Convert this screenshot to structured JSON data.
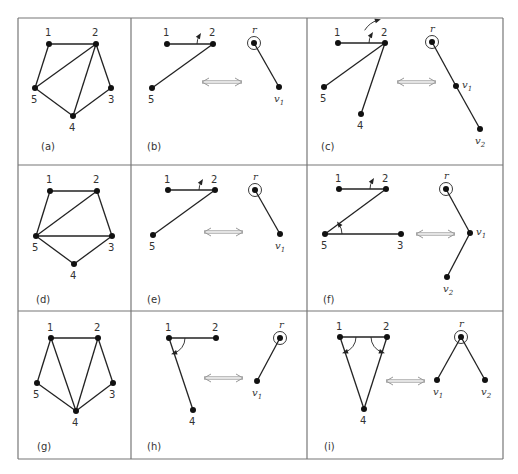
{
  "figure": {
    "grid": {
      "left": 18,
      "top": 18,
      "right": 503,
      "bottom": 459,
      "cols": [
        18,
        131,
        307,
        503
      ],
      "rows": [
        18,
        165,
        311,
        459
      ],
      "stroke": "#777777"
    },
    "colors": {
      "edge": "#222222",
      "node": "#111111",
      "arrow": "#999999",
      "label": "#333333"
    },
    "panels": [
      {
        "id": "a",
        "caption": "(a)",
        "caption_pos": [
          41,
          150
        ],
        "nodes": [
          {
            "id": "1",
            "x": 49,
            "y": 44,
            "lx": 45,
            "ly": 36
          },
          {
            "id": "2",
            "x": 96,
            "y": 44,
            "lx": 92,
            "ly": 36
          },
          {
            "id": "3",
            "x": 111,
            "y": 88,
            "lx": 108,
            "ly": 103
          },
          {
            "id": "4",
            "x": 73,
            "y": 116,
            "lx": 69,
            "ly": 131
          },
          {
            "id": "5",
            "x": 35,
            "y": 88,
            "lx": 31,
            "ly": 103
          }
        ],
        "edges": [
          [
            "1",
            "2"
          ],
          [
            "1",
            "5"
          ],
          [
            "2",
            "5"
          ],
          [
            "2",
            "4"
          ],
          [
            "2",
            "3"
          ],
          [
            "3",
            "4"
          ],
          [
            "4",
            "5"
          ]
        ],
        "angles": [],
        "tree": null,
        "arrow": null
      },
      {
        "id": "b",
        "caption": "(b)",
        "caption_pos": [
          147,
          150
        ],
        "nodes": [
          {
            "id": "1",
            "x": 167,
            "y": 44,
            "lx": 163,
            "ly": 36
          },
          {
            "id": "2",
            "x": 213,
            "y": 44,
            "lx": 209,
            "ly": 36
          },
          {
            "id": "5",
            "x": 152,
            "y": 88,
            "lx": 148,
            "ly": 103
          }
        ],
        "edges": [
          [
            "1",
            "2"
          ],
          [
            "2",
            "5"
          ]
        ],
        "angles": [
          {
            "cx": 213,
            "cy": 44,
            "r": 16,
            "from": 180,
            "to": 212
          }
        ],
        "arrow": {
          "x1": 202,
          "x2": 242,
          "y": 82
        },
        "tree": {
          "root": {
            "label": "r",
            "x": 254,
            "y": 43,
            "lx": 252,
            "ly": 33
          },
          "nodes": [
            {
              "label": "v",
              "sub": "1",
              "x": 279,
              "y": 87,
              "lx": 274,
              "ly": 102
            }
          ],
          "edges": [
            [
              "r",
              "v1"
            ]
          ]
        }
      },
      {
        "id": "c",
        "caption": "(c)",
        "caption_pos": [
          321,
          150
        ],
        "nodes": [
          {
            "id": "1",
            "x": 338,
            "y": 43,
            "lx": 334,
            "ly": 36
          },
          {
            "id": "2",
            "x": 385,
            "y": 43,
            "lx": 381,
            "ly": 36
          },
          {
            "id": "5",
            "x": 324,
            "y": 87,
            "lx": 320,
            "ly": 102
          },
          {
            "id": "4",
            "x": 361,
            "y": 114,
            "lx": 357,
            "ly": 129
          }
        ],
        "edges": [
          [
            "1",
            "2"
          ],
          [
            "2",
            "5"
          ],
          [
            "2",
            "4"
          ]
        ],
        "angles": [
          {
            "cx": 385,
            "cy": 43,
            "r": 16,
            "from": 180,
            "to": 212
          },
          {
            "cx": 385,
            "cy": 43,
            "r": 24,
            "from": 212,
            "to": 253
          }
        ],
        "arrow": {
          "x1": 397,
          "x2": 436,
          "y": 82
        },
        "tree": {
          "root": {
            "label": "r",
            "x": 432,
            "y": 42,
            "lx": 430,
            "ly": 32
          },
          "nodes": [
            {
              "label": "v",
              "sub": "1",
              "x": 456,
              "y": 86,
              "lx": 462,
              "ly": 88
            },
            {
              "label": "v",
              "sub": "2",
              "x": 480,
              "y": 129,
              "lx": 475,
              "ly": 144
            }
          ],
          "edges": [
            [
              "r",
              "v1"
            ],
            [
              "v1",
              "v2"
            ]
          ]
        }
      },
      {
        "id": "d",
        "caption": "(d)",
        "caption_pos": [
          36,
          303
        ],
        "nodes": [
          {
            "id": "1",
            "x": 50,
            "y": 191,
            "lx": 46,
            "ly": 183
          },
          {
            "id": "2",
            "x": 97,
            "y": 191,
            "lx": 93,
            "ly": 183
          },
          {
            "id": "3",
            "x": 112,
            "y": 236,
            "lx": 108,
            "ly": 251
          },
          {
            "id": "4",
            "x": 74,
            "y": 264,
            "lx": 70,
            "ly": 279
          },
          {
            "id": "5",
            "x": 36,
            "y": 236,
            "lx": 32,
            "ly": 251
          }
        ],
        "edges": [
          [
            "1",
            "2"
          ],
          [
            "1",
            "5"
          ],
          [
            "2",
            "5"
          ],
          [
            "2",
            "3"
          ],
          [
            "5",
            "3"
          ],
          [
            "3",
            "4"
          ],
          [
            "4",
            "5"
          ]
        ],
        "angles": [],
        "tree": null,
        "arrow": null
      },
      {
        "id": "e",
        "caption": "(e)",
        "caption_pos": [
          147,
          303
        ],
        "nodes": [
          {
            "id": "1",
            "x": 168,
            "y": 190,
            "lx": 164,
            "ly": 183
          },
          {
            "id": "2",
            "x": 215,
            "y": 190,
            "lx": 211,
            "ly": 183
          },
          {
            "id": "5",
            "x": 153,
            "y": 235,
            "lx": 149,
            "ly": 250
          }
        ],
        "edges": [
          [
            "1",
            "2"
          ],
          [
            "2",
            "5"
          ]
        ],
        "angles": [
          {
            "cx": 215,
            "cy": 190,
            "r": 16,
            "from": 180,
            "to": 212
          }
        ],
        "arrow": {
          "x1": 204,
          "x2": 243,
          "y": 232
        },
        "tree": {
          "root": {
            "label": "r",
            "x": 255,
            "y": 190,
            "lx": 253,
            "ly": 180
          },
          "nodes": [
            {
              "label": "v",
              "sub": "1",
              "x": 280,
              "y": 234,
              "lx": 275,
              "ly": 249
            }
          ],
          "edges": [
            [
              "r",
              "v1"
            ]
          ]
        }
      },
      {
        "id": "f",
        "caption": "(f)",
        "caption_pos": [
          323,
          303
        ],
        "nodes": [
          {
            "id": "1",
            "x": 339,
            "y": 189,
            "lx": 335,
            "ly": 182
          },
          {
            "id": "2",
            "x": 386,
            "y": 189,
            "lx": 382,
            "ly": 182
          },
          {
            "id": "5",
            "x": 325,
            "y": 234,
            "lx": 321,
            "ly": 249
          },
          {
            "id": "3",
            "x": 401,
            "y": 234,
            "lx": 397,
            "ly": 249
          }
        ],
        "edges": [
          [
            "1",
            "2"
          ],
          [
            "2",
            "5"
          ],
          [
            "5",
            "3"
          ]
        ],
        "angles": [
          {
            "cx": 386,
            "cy": 189,
            "r": 16,
            "from": 180,
            "to": 212
          },
          {
            "cx": 325,
            "cy": 234,
            "r": 17,
            "from": 0,
            "to": -36
          }
        ],
        "arrow": {
          "x1": 416,
          "x2": 455,
          "y": 234
        },
        "tree": {
          "root": {
            "label": "r",
            "x": 446,
            "y": 189,
            "lx": 444,
            "ly": 179
          },
          "nodes": [
            {
              "label": "v",
              "sub": "1",
              "x": 470,
              "y": 233,
              "lx": 476,
              "ly": 235
            },
            {
              "label": "v",
              "sub": "2",
              "x": 447,
              "y": 277,
              "lx": 443,
              "ly": 292
            }
          ],
          "edges": [
            [
              "r",
              "v1"
            ],
            [
              "v1",
              "v2"
            ]
          ]
        }
      },
      {
        "id": "g",
        "caption": "(g)",
        "caption_pos": [
          37,
          450
        ],
        "nodes": [
          {
            "id": "1",
            "x": 51,
            "y": 338,
            "lx": 47,
            "ly": 331
          },
          {
            "id": "2",
            "x": 98,
            "y": 338,
            "lx": 94,
            "ly": 331
          },
          {
            "id": "3",
            "x": 113,
            "y": 383,
            "lx": 109,
            "ly": 398
          },
          {
            "id": "4",
            "x": 76,
            "y": 411,
            "lx": 72,
            "ly": 426
          },
          {
            "id": "5",
            "x": 37,
            "y": 383,
            "lx": 33,
            "ly": 398
          }
        ],
        "edges": [
          [
            "1",
            "2"
          ],
          [
            "1",
            "5"
          ],
          [
            "1",
            "4"
          ],
          [
            "2",
            "4"
          ],
          [
            "2",
            "3"
          ],
          [
            "3",
            "4"
          ],
          [
            "4",
            "5"
          ]
        ],
        "angles": [],
        "tree": null,
        "arrow": null
      },
      {
        "id": "h",
        "caption": "(h)",
        "caption_pos": [
          147,
          450
        ],
        "nodes": [
          {
            "id": "1",
            "x": 169,
            "y": 338,
            "lx": 165,
            "ly": 331
          },
          {
            "id": "2",
            "x": 216,
            "y": 338,
            "lx": 212,
            "ly": 331
          },
          {
            "id": "4",
            "x": 193,
            "y": 410,
            "lx": 189,
            "ly": 425
          }
        ],
        "edges": [
          [
            "1",
            "2"
          ],
          [
            "1",
            "4"
          ]
        ],
        "angles": [
          {
            "cx": 169,
            "cy": 338,
            "r": 16,
            "from": 0,
            "to": 72
          }
        ],
        "arrow": {
          "x1": 204,
          "x2": 243,
          "y": 378
        },
        "tree": {
          "root": {
            "label": "r",
            "x": 280,
            "y": 338,
            "lx": 279,
            "ly": 328
          },
          "nodes": [
            {
              "label": "v",
              "sub": "1",
              "x": 257,
              "y": 381,
              "lx": 252,
              "ly": 396
            }
          ],
          "edges": [
            [
              "r",
              "v1"
            ]
          ]
        }
      },
      {
        "id": "i",
        "caption": "(i)",
        "caption_pos": [
          324,
          450
        ],
        "nodes": [
          {
            "id": "1",
            "x": 340,
            "y": 337,
            "lx": 336,
            "ly": 330
          },
          {
            "id": "2",
            "x": 387,
            "y": 337,
            "lx": 383,
            "ly": 330
          },
          {
            "id": "4",
            "x": 364,
            "y": 409,
            "lx": 360,
            "ly": 424
          }
        ],
        "edges": [
          [
            "1",
            "2"
          ],
          [
            "1",
            "4"
          ],
          [
            "2",
            "4"
          ]
        ],
        "angles": [
          {
            "cx": 340,
            "cy": 337,
            "r": 16,
            "from": 0,
            "to": 72
          },
          {
            "cx": 387,
            "cy": 337,
            "r": 16,
            "from": 180,
            "to": 108
          }
        ],
        "arrow": {
          "x1": 386,
          "x2": 425,
          "y": 381
        },
        "tree": {
          "root": {
            "label": "r",
            "x": 461,
            "y": 337,
            "lx": 459,
            "ly": 327
          },
          "nodes": [
            {
              "label": "v",
              "sub": "1",
              "x": 437,
              "y": 380,
              "lx": 433,
              "ly": 395
            },
            {
              "label": "v",
              "sub": "2",
              "x": 485,
              "y": 380,
              "lx": 481,
              "ly": 395
            }
          ],
          "edges": [
            [
              "r",
              "v1"
            ],
            [
              "r",
              "v2"
            ]
          ]
        }
      }
    ]
  }
}
